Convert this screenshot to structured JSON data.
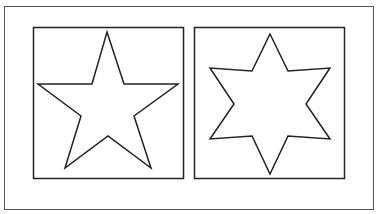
{
  "figure": {
    "panels": [
      {
        "label": "five-pointed star",
        "points": 5
      },
      {
        "label": "six-pointed star",
        "points": 6
      }
    ],
    "colors": {
      "stroke": "#222222",
      "outer_frame": "#555555",
      "background": "#ffffff"
    }
  }
}
